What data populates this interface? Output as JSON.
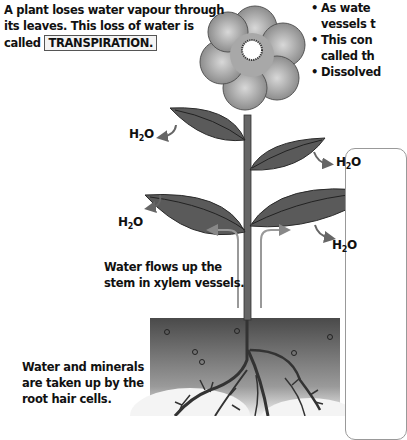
{
  "intro": {
    "line1": "A plant loses water vapour through",
    "line2": "its leaves. This loss of water is",
    "line3_prefix": "called",
    "keyword": "TRANSPIRATION."
  },
  "bullets": [
    {
      "line1": "As wate",
      "line2": "vessels t"
    },
    {
      "line1": "This con",
      "line2": "called th"
    },
    {
      "line1": "Dissolved"
    }
  ],
  "labels": {
    "h2o_1": "H",
    "h2o_sub": "2",
    "h2o_o": "O",
    "stem_line1": "Water flows up the",
    "stem_line2": "stem in xylem vessels.",
    "roots_line1": "Water and minerals",
    "roots_line2": "are taken up by the",
    "roots_line3": "root hair cells."
  },
  "colors": {
    "leaf": "#555555",
    "stem": "#666666",
    "petal": "#9a9a9a",
    "soil_top": "#4a4a4a",
    "arrow": "#888888"
  }
}
